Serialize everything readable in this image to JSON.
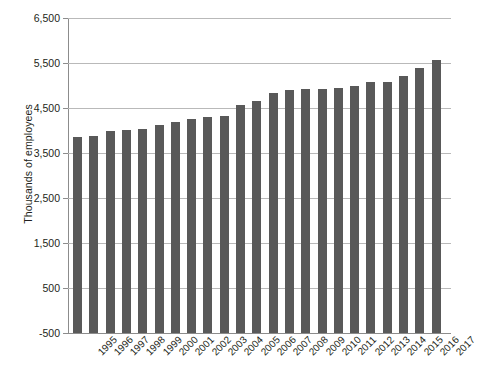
{
  "chart_data": {
    "type": "bar",
    "title": "",
    "subtitle": "",
    "xlabel": "",
    "ylabel": "Thousands of employees",
    "ylim": [
      -500,
      6500
    ],
    "ytick_step": 1000,
    "ytick_labels": [
      "6,500",
      "5,500",
      "4,500",
      "3,500",
      "2,500",
      "1,500",
      "500",
      "-500"
    ],
    "ytick_values": [
      6500,
      5500,
      4500,
      3500,
      2500,
      1500,
      500,
      -500
    ],
    "grid": true,
    "legend": "none",
    "bar_color": "#595959",
    "grid_color": "#b9b9b9",
    "axis_color": "#8c8c8c",
    "categories": [
      "1995",
      "1996",
      "1997",
      "1998",
      "1999",
      "2000",
      "2001",
      "2002",
      "2003",
      "2004",
      "2005",
      "2006",
      "2007",
      "2008",
      "2009",
      "2010",
      "2011",
      "2012",
      "2013",
      "2014",
      "2015",
      "2016",
      "2017"
    ],
    "values": [
      3850,
      3870,
      4000,
      4020,
      4040,
      4120,
      4180,
      4260,
      4300,
      4320,
      4560,
      4660,
      4840,
      4900,
      4920,
      4930,
      4940,
      5000,
      5070,
      5080,
      5220,
      5400,
      5570
    ]
  }
}
